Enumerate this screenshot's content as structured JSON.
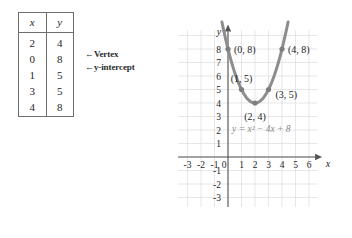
{
  "table": {
    "headers": [
      "x",
      "y"
    ],
    "rows": [
      {
        "x": "2",
        "y": "4"
      },
      {
        "x": "0",
        "y": "8"
      },
      {
        "x": "1",
        "y": "5"
      },
      {
        "x": "3",
        "y": "5"
      },
      {
        "x": "4",
        "y": "8"
      }
    ]
  },
  "annotations": {
    "vertex": "←Vertex",
    "y_intercept": "←y-intercept"
  },
  "chart_data": {
    "type": "line",
    "title": "",
    "equation": "y = x² − 4x + 8",
    "xlabel": "x",
    "ylabel": "y",
    "xlim": [
      -3.6,
      6.6
    ],
    "ylim": [
      -3.6,
      9.2
    ],
    "grid": true,
    "legend": "none",
    "x_ticks": [
      "-3",
      "-2",
      "-1",
      "0",
      "1",
      "2",
      "3",
      "4",
      "5",
      "6"
    ],
    "x_tick_values": [
      -3,
      -2,
      -1,
      0,
      1,
      2,
      3,
      4,
      5,
      6
    ],
    "y_ticks": [
      "8",
      "7",
      "6",
      "5",
      "4",
      "3",
      "2",
      "1",
      "-1",
      "-2",
      "-3"
    ],
    "y_tick_values": [
      8,
      7,
      6,
      5,
      4,
      3,
      2,
      1,
      -1,
      -2,
      -3
    ],
    "points": [
      {
        "label": "(0, 8)",
        "x": 0,
        "y": 8
      },
      {
        "label": "(1, 5)",
        "x": 1,
        "y": 5
      },
      {
        "label": "(2, 4)",
        "x": 2,
        "y": 4
      },
      {
        "label": "(3, 5)",
        "x": 3,
        "y": 5
      },
      {
        "label": "(4, 8)",
        "x": 4,
        "y": 8
      }
    ],
    "series": [
      {
        "name": "y = x^2 - 4x + 8",
        "x": [
          -0.4,
          0,
          0.5,
          1,
          1.5,
          2,
          2.5,
          3,
          3.5,
          4,
          4.4
        ],
        "values": [
          9.76,
          8,
          6.25,
          5,
          4.25,
          4,
          4.25,
          5,
          6.25,
          8,
          9.76
        ]
      }
    ],
    "colors": {
      "curve": "#8d8d8d",
      "grid": "#d6d6dd",
      "axis": "#555555",
      "equation_text": "#8a8a8a"
    }
  }
}
